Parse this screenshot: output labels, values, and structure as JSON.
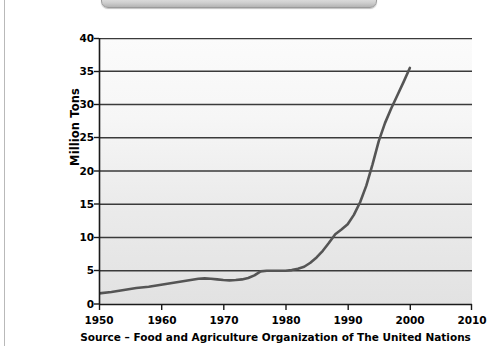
{
  "chart_data": {
    "type": "line",
    "title": "",
    "subtitle": "",
    "xlabel": "",
    "ylabel": "Million Tons",
    "annotation": "Source – Food and Agriculture Organization of The United Nations",
    "xlim": [
      1950,
      2010
    ],
    "ylim": [
      0,
      40
    ],
    "x_ticks": [
      1950,
      1960,
      1970,
      1980,
      1990,
      2000,
      2010
    ],
    "y_ticks": [
      0,
      5,
      10,
      15,
      20,
      25,
      30,
      35,
      40
    ],
    "grid": "horizontal",
    "legend": "none",
    "series": [
      {
        "name": "Production",
        "color": "#555555",
        "x": [
          1950,
          1952,
          1954,
          1956,
          1958,
          1960,
          1962,
          1964,
          1966,
          1967,
          1968,
          1969,
          1970,
          1971,
          1972,
          1973,
          1974,
          1975,
          1976,
          1977,
          1978,
          1979,
          1980,
          1981,
          1982,
          1983,
          1984,
          1985,
          1986,
          1987,
          1988,
          1989,
          1990,
          1991,
          1992,
          1993,
          1994,
          1995,
          1996,
          1997,
          1998,
          1999,
          2000
        ],
        "values": [
          1.6,
          1.8,
          2.1,
          2.4,
          2.6,
          2.9,
          3.2,
          3.5,
          3.8,
          3.85,
          3.8,
          3.7,
          3.6,
          3.55,
          3.6,
          3.7,
          3.9,
          4.3,
          4.9,
          5.0,
          5.0,
          5.0,
          5.0,
          5.1,
          5.3,
          5.6,
          6.2,
          7.0,
          8.0,
          9.2,
          10.5,
          11.2,
          12.0,
          13.4,
          15.3,
          17.8,
          21.0,
          24.5,
          27.2,
          29.4,
          31.4,
          33.4,
          35.5
        ]
      }
    ]
  },
  "axis": {
    "y_title": "Million Tons",
    "y_tick_labels": [
      "40",
      "35",
      "30",
      "25",
      "20",
      "15",
      "10",
      "5",
      "0"
    ],
    "x_tick_labels": [
      "1950",
      "1960",
      "1970",
      "1980",
      "1990",
      "2000",
      "2010"
    ]
  },
  "caption": {
    "source": "Source – Food and Agriculture Organization of The United Nations"
  },
  "colors": {
    "line": "#555555",
    "gridline": "#3a3a3a",
    "axis": "#1a1a1a",
    "plot_bg_top": "#fbfbfb",
    "plot_bg_bottom": "#e2e2e2",
    "page_bg": "#ffffff"
  }
}
